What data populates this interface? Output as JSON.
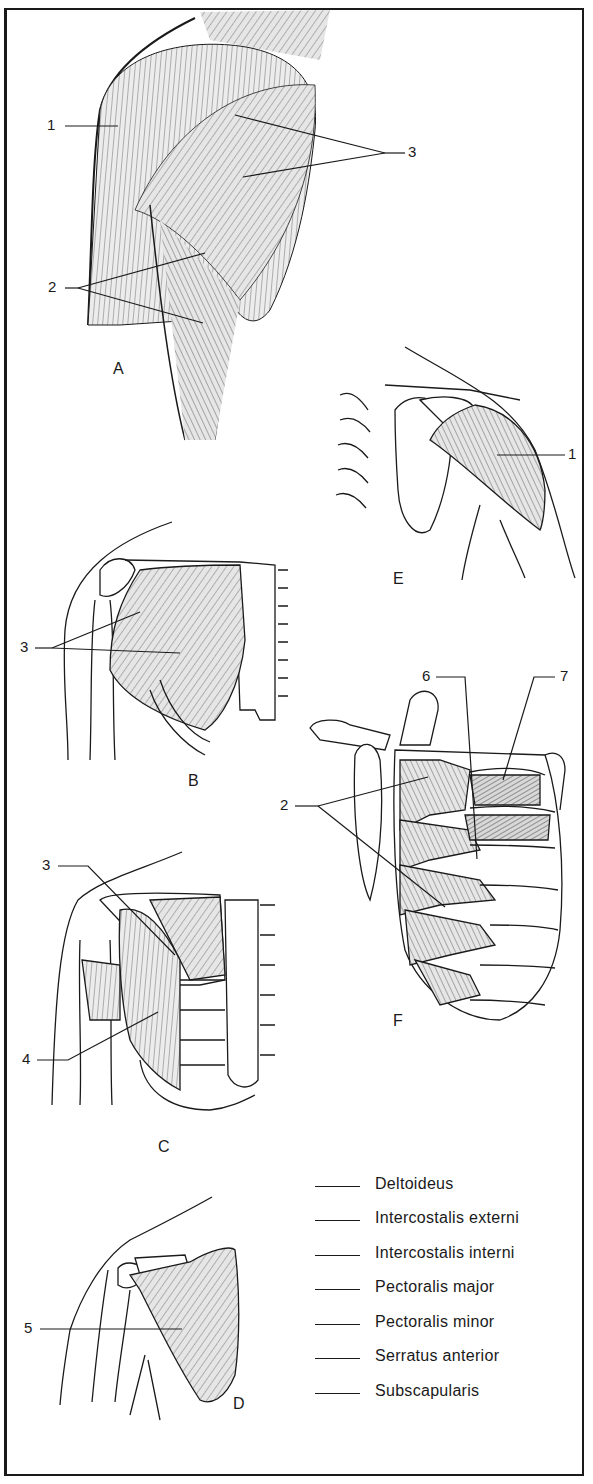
{
  "figure": {
    "panels": [
      {
        "id": "A",
        "label": "A",
        "callouts": [
          "1",
          "2",
          "3"
        ]
      },
      {
        "id": "B",
        "label": "B",
        "callouts": [
          "3"
        ]
      },
      {
        "id": "C",
        "label": "C",
        "callouts": [
          "3",
          "4"
        ]
      },
      {
        "id": "D",
        "label": "D",
        "callouts": [
          "5"
        ]
      },
      {
        "id": "E",
        "label": "E",
        "callouts": [
          "1"
        ]
      },
      {
        "id": "F",
        "label": "F",
        "callouts": [
          "6",
          "7",
          "2"
        ]
      }
    ],
    "callout_labels": {
      "a1": "1",
      "a2": "2",
      "a3": "3",
      "b3": "3",
      "c3": "3",
      "c4": "4",
      "d5": "5",
      "e1": "1",
      "f6": "6",
      "f7": "7",
      "f2": "2"
    },
    "panel_letters": {
      "a": "A",
      "b": "B",
      "c": "C",
      "d": "D",
      "e": "E",
      "f": "F"
    }
  },
  "legend": {
    "items": [
      {
        "blank": "",
        "term": "Deltoideus"
      },
      {
        "blank": "",
        "term": "Intercostalis externi"
      },
      {
        "blank": "",
        "term": "Intercostalis interni"
      },
      {
        "blank": "",
        "term": "Pectoralis major"
      },
      {
        "blank": "",
        "term": "Pectoralis minor"
      },
      {
        "blank": "",
        "term": "Serratus anterior"
      },
      {
        "blank": "",
        "term": "Subscapularis"
      }
    ]
  },
  "colors": {
    "ink": "#1a1a1a",
    "muscle_fill": "#e4e4e4",
    "paper": "#ffffff"
  }
}
